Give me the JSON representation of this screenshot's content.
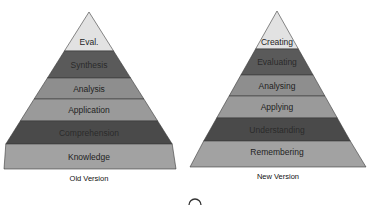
{
  "diagram": {
    "type": "pyramid-comparison",
    "pyramids": [
      {
        "caption": "Old Version",
        "layers_top_to_bottom": [
          {
            "label": "Eval.",
            "color": "#e2e2e2"
          },
          {
            "label": "Synthesis",
            "color": "#5a5a5a"
          },
          {
            "label": "Analysis",
            "color": "#8e8e8e"
          },
          {
            "label": "Application",
            "color": "#9a9a9a"
          },
          {
            "label": "Comprehension",
            "color": "#4a4a4a"
          },
          {
            "label": "Knowledge",
            "color": "#a2a2a2"
          }
        ]
      },
      {
        "caption": "New Version",
        "layers_top_to_bottom": [
          {
            "label": "Creating",
            "color": "#e2e2e2"
          },
          {
            "label": "Evaluating",
            "color": "#5a5a5a"
          },
          {
            "label": "Analysing",
            "color": "#8e8e8e"
          },
          {
            "label": "Applying",
            "color": "#9a9a9a"
          },
          {
            "label": "Understanding",
            "color": "#4a4a4a"
          },
          {
            "label": "Remembering",
            "color": "#a2a2a2"
          }
        ]
      }
    ]
  },
  "colors": {
    "outline": "#3a3a3a",
    "background": "#ffffff"
  }
}
